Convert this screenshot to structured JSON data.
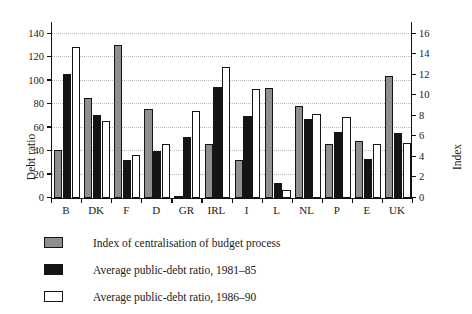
{
  "chart_data": {
    "type": "bar",
    "title": "",
    "subtitle": "",
    "categories": [
      "B",
      "DK",
      "F",
      "D",
      "GR",
      "IRL",
      "I",
      "L",
      "NL",
      "P",
      "E",
      "UK"
    ],
    "series": [
      {
        "name": "Index of centralisation of budget process",
        "axis": "right",
        "color": "#8f8f8f",
        "values": [
          4.7,
          9.7,
          14.9,
          8.7,
          0.2,
          5.3,
          3.7,
          10.7,
          8.9,
          5.3,
          5.6,
          11.9
        ]
      },
      {
        "name": "Average public-debt ratio, 1981–85",
        "axis": "left",
        "color": "#141414",
        "values": [
          106,
          71,
          32,
          40,
          52,
          95,
          70,
          13,
          67,
          56,
          33,
          55
        ]
      },
      {
        "name": "Average public-debt ratio, 1986–90",
        "axis": "left",
        "color": "#ffffff",
        "values": [
          129,
          66,
          37,
          46,
          74,
          112,
          93,
          7,
          72,
          69,
          46,
          47
        ]
      }
    ],
    "index_series_as_debt_scale": [
      41,
      85,
      130,
      76,
      2,
      46,
      32,
      94,
      78,
      46,
      49,
      104
    ],
    "xlabel": "",
    "ylabel": "Debt ratio",
    "ylabel_right": "Index",
    "ylim": [
      0,
      150
    ],
    "ylim_right": [
      0,
      17.142857
    ],
    "yticks": [
      0,
      20,
      40,
      60,
      80,
      100,
      120,
      140
    ],
    "yticks_right": [
      0,
      2,
      4,
      6,
      8,
      10,
      12,
      14,
      16
    ],
    "grid": true,
    "legend_position": "below"
  },
  "axes": {
    "left_title": "Debt ratio",
    "right_title": "Index",
    "left_ticks": [
      "0",
      "20",
      "40",
      "60",
      "80",
      "100",
      "120",
      "140"
    ],
    "right_ticks": [
      "0",
      "2",
      "4",
      "6",
      "8",
      "10",
      "12",
      "14",
      "16"
    ],
    "categories": [
      "B",
      "DK",
      "F",
      "D",
      "GR",
      "IRL",
      "I",
      "L",
      "NL",
      "P",
      "E",
      "UK"
    ]
  },
  "legend": {
    "items": [
      {
        "label": "Index of centralisation of budget process",
        "swatch": "series-index"
      },
      {
        "label": "Average public-debt ratio, 1981–85",
        "swatch": "series-d8185"
      },
      {
        "label": "Average public-debt ratio, 1986–90",
        "swatch": "series-d8690"
      }
    ]
  }
}
